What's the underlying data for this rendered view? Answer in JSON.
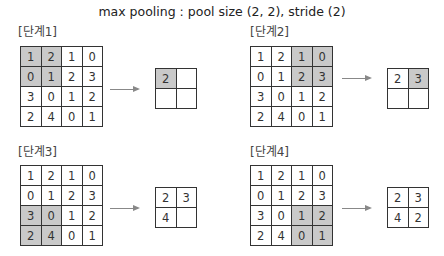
{
  "title": "max pooling : pool size (2, 2), stride (2)",
  "input_matrix": [
    [
      1,
      2,
      1,
      0
    ],
    [
      0,
      1,
      2,
      3
    ],
    [
      3,
      0,
      1,
      2
    ],
    [
      2,
      4,
      0,
      1
    ]
  ],
  "highlight_color": "#c9c9c9",
  "steps": [
    {
      "label": "[단계1]",
      "highlight": [
        [
          0,
          0
        ],
        [
          0,
          1
        ],
        [
          1,
          0
        ],
        [
          1,
          1
        ]
      ],
      "output": [
        [
          "2",
          ""
        ],
        [
          "",
          ""
        ]
      ],
      "output_highlight": [
        [
          0,
          0
        ]
      ]
    },
    {
      "label": "[단계2]",
      "highlight": [
        [
          0,
          2
        ],
        [
          0,
          3
        ],
        [
          1,
          2
        ],
        [
          1,
          3
        ]
      ],
      "output": [
        [
          "2",
          "3"
        ],
        [
          "",
          ""
        ]
      ],
      "output_highlight": [
        [
          0,
          1
        ]
      ]
    },
    {
      "label": "[단계3]",
      "highlight": [
        [
          2,
          0
        ],
        [
          2,
          1
        ],
        [
          3,
          0
        ],
        [
          3,
          1
        ]
      ],
      "output": [
        [
          "2",
          "3"
        ],
        [
          "4",
          ""
        ]
      ],
      "output_highlight": []
    },
    {
      "label": "[단계4]",
      "highlight": [
        [
          2,
          2
        ],
        [
          2,
          3
        ],
        [
          3,
          2
        ],
        [
          3,
          3
        ]
      ],
      "output": [
        [
          "2",
          "3"
        ],
        [
          "4",
          "2"
        ]
      ],
      "output_highlight": []
    }
  ]
}
